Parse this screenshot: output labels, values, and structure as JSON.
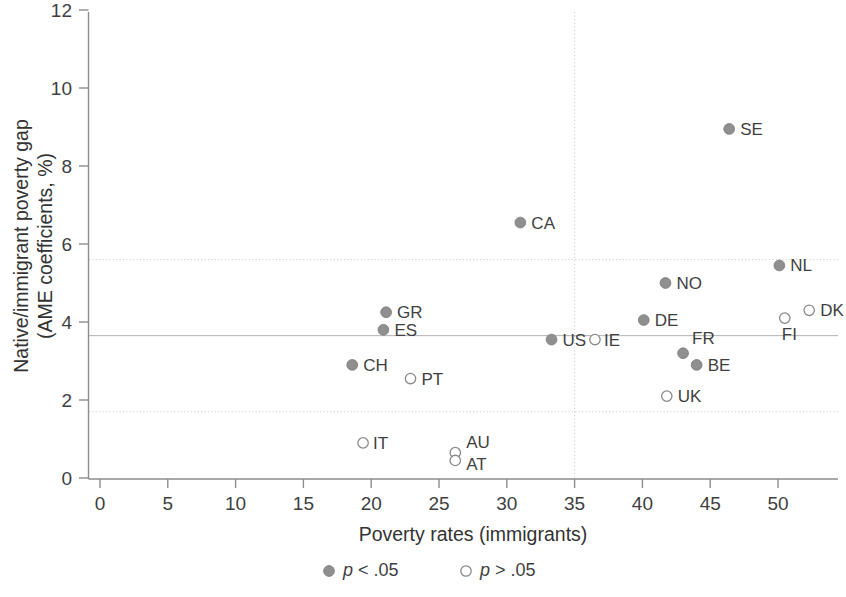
{
  "chart_data": {
    "type": "scatter",
    "title": "",
    "xlabel": "Poverty rates (immigrants)",
    "ylabel_line1": "Native/immigrant poverty gap",
    "ylabel_line2": "(AME coefficients, %)",
    "xlim": [
      0,
      54
    ],
    "ylim": [
      0,
      12
    ],
    "xticks": [
      0,
      5,
      10,
      15,
      20,
      25,
      30,
      35,
      40,
      45,
      50
    ],
    "xtick_labels": [
      "0",
      "5",
      "10",
      "15",
      "20",
      "25",
      "30",
      "35",
      "40",
      "45",
      "50"
    ],
    "yticks": [
      0,
      2,
      4,
      6,
      8,
      10,
      12
    ],
    "ytick_labels": [
      "0",
      "2",
      "4",
      "6",
      "8",
      "10",
      "12"
    ],
    "grid": false,
    "reference_lines": {
      "horizontal_solid": 3.65,
      "horizontal_dotted": [
        5.6,
        1.7
      ],
      "vertical_dotted": 35
    },
    "legend": {
      "position": "below-axis-center",
      "entries": [
        {
          "marker": "filled",
          "label": "p < .05",
          "label_italic_prefix": "p",
          "label_rest": " < .05"
        },
        {
          "marker": "open",
          "label": "p > .05",
          "label_italic_prefix": "p",
          "label_rest": " > .05"
        }
      ]
    },
    "points": [
      {
        "code": "SE",
        "x": 46.4,
        "y": 8.95,
        "significant": true,
        "label_dx": 11,
        "label_dy": 6
      },
      {
        "code": "CA",
        "x": 31.0,
        "y": 6.55,
        "significant": true,
        "label_dx": 11,
        "label_dy": 6
      },
      {
        "code": "NL",
        "x": 50.1,
        "y": 5.45,
        "significant": true,
        "label_dx": 11,
        "label_dy": 6
      },
      {
        "code": "NO",
        "x": 41.7,
        "y": 5.0,
        "significant": true,
        "label_dx": 11,
        "label_dy": 6
      },
      {
        "code": "GR",
        "x": 21.1,
        "y": 4.25,
        "significant": true,
        "label_dx": 11,
        "label_dy": 6
      },
      {
        "code": "DK",
        "x": 52.3,
        "y": 4.3,
        "significant": false,
        "label_dx": 11,
        "label_dy": 6
      },
      {
        "code": "FI",
        "x": 50.5,
        "y": 4.1,
        "significant": false,
        "label_dx": -3,
        "label_dy": 22
      },
      {
        "code": "DE",
        "x": 40.1,
        "y": 4.05,
        "significant": true,
        "label_dx": 11,
        "label_dy": 6
      },
      {
        "code": "ES",
        "x": 20.9,
        "y": 3.8,
        "significant": true,
        "label_dx": 11,
        "label_dy": 6
      },
      {
        "code": "US",
        "x": 33.3,
        "y": 3.55,
        "significant": true,
        "label_dx": 11,
        "label_dy": 6
      },
      {
        "code": "IE",
        "x": 36.5,
        "y": 3.55,
        "significant": false,
        "label_dx": 9,
        "label_dy": 6
      },
      {
        "code": "FR",
        "x": 43.0,
        "y": 3.2,
        "significant": true,
        "label_dx": 9,
        "label_dy": -9
      },
      {
        "code": "BE",
        "x": 44.0,
        "y": 2.9,
        "significant": true,
        "label_dx": 11,
        "label_dy": 6
      },
      {
        "code": "CH",
        "x": 18.6,
        "y": 2.9,
        "significant": true,
        "label_dx": 11,
        "label_dy": 6
      },
      {
        "code": "PT",
        "x": 22.9,
        "y": 2.55,
        "significant": false,
        "label_dx": 11,
        "label_dy": 6
      },
      {
        "code": "UK",
        "x": 41.8,
        "y": 2.1,
        "significant": false,
        "label_dx": 11,
        "label_dy": 6
      },
      {
        "code": "IT",
        "x": 19.4,
        "y": 0.9,
        "significant": false,
        "label_dx": 10,
        "label_dy": 6
      },
      {
        "code": "AU",
        "x": 26.2,
        "y": 0.65,
        "significant": false,
        "label_dx": 11,
        "label_dy": -5
      },
      {
        "code": "AT",
        "x": 26.2,
        "y": 0.45,
        "significant": false,
        "label_dx": 11,
        "label_dy": 10
      }
    ]
  }
}
